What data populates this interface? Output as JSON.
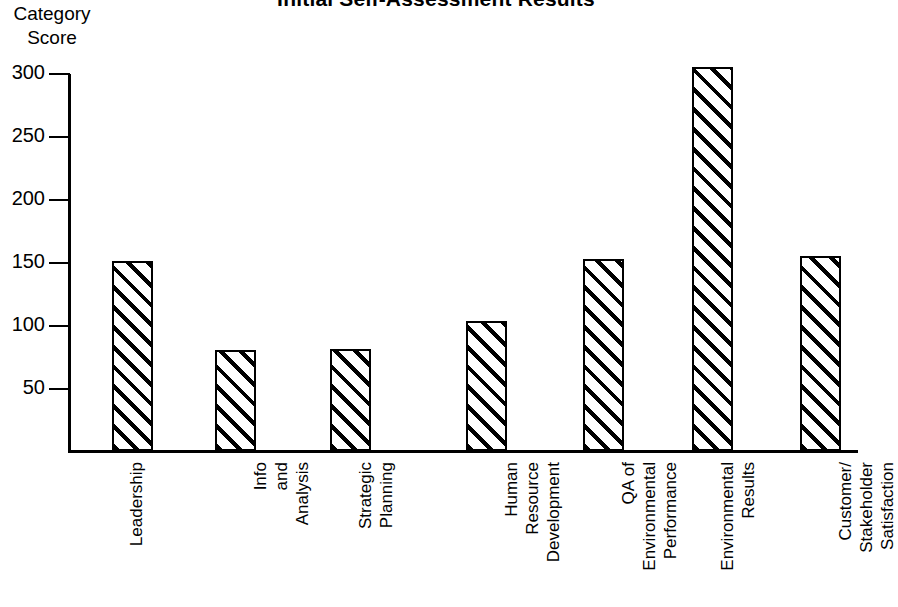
{
  "chart_data": {
    "type": "bar",
    "title": "Initial Self-Assessment Results",
    "ylabel_lines": [
      "Category",
      "Score"
    ],
    "xlabel": "",
    "ylim": [
      0,
      320
    ],
    "yticks": [
      50,
      100,
      150,
      200,
      250,
      300
    ],
    "ytick_labels": [
      "50",
      "100",
      "150",
      "200",
      "250",
      "300"
    ],
    "grid": false,
    "legend": "none",
    "bar_style": "diagonal-hatch",
    "categories": [
      "Leadership",
      "Info and Analysis",
      "Strategic Planning",
      "Human Resource Development",
      "QA of Environmental Performance",
      "Environmental Results",
      "Customer/ Stakeholder Satisfaction"
    ],
    "category_label_lines": [
      [
        "Leadership"
      ],
      [
        "Info",
        "and",
        "Analysis"
      ],
      [
        "Strategic",
        "Planning"
      ],
      [
        "Human",
        "Resource",
        "Development"
      ],
      [
        "QA of",
        "Environmental",
        "Performance"
      ],
      [
        "Environmental",
        "Results"
      ],
      [
        "Customer/",
        "Stakeholder",
        "Satisfaction"
      ]
    ],
    "values": [
      151,
      80,
      81,
      103,
      152,
      305,
      155
    ],
    "colors": {
      "axis": "#000000",
      "bar_outline": "#000000",
      "bar_fill": "#ffffff",
      "hatch": "#000000",
      "background": "#ffffff",
      "text": "#000000"
    }
  }
}
